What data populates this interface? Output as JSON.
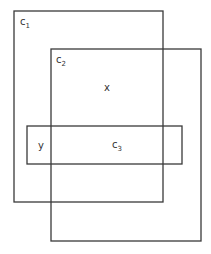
{
  "diagram": {
    "type": "overlapping-sets",
    "colors": {
      "stroke": "#3a3a3a",
      "text": "#333333",
      "background": "#ffffff"
    },
    "sets": [
      {
        "id": "c1",
        "label_base": "c",
        "label_sub": "1",
        "rect": {
          "x": 14,
          "y": 11,
          "w": 149,
          "h": 191
        }
      },
      {
        "id": "c2",
        "label_base": "c",
        "label_sub": "2",
        "rect": {
          "x": 51,
          "y": 49,
          "w": 150,
          "h": 192
        }
      },
      {
        "id": "c3",
        "label_base": "c",
        "label_sub": "3",
        "rect": {
          "x": 27,
          "y": 126,
          "w": 155,
          "h": 38
        }
      }
    ],
    "points": [
      {
        "id": "x",
        "label": "x"
      },
      {
        "id": "y",
        "label": "y"
      }
    ]
  }
}
